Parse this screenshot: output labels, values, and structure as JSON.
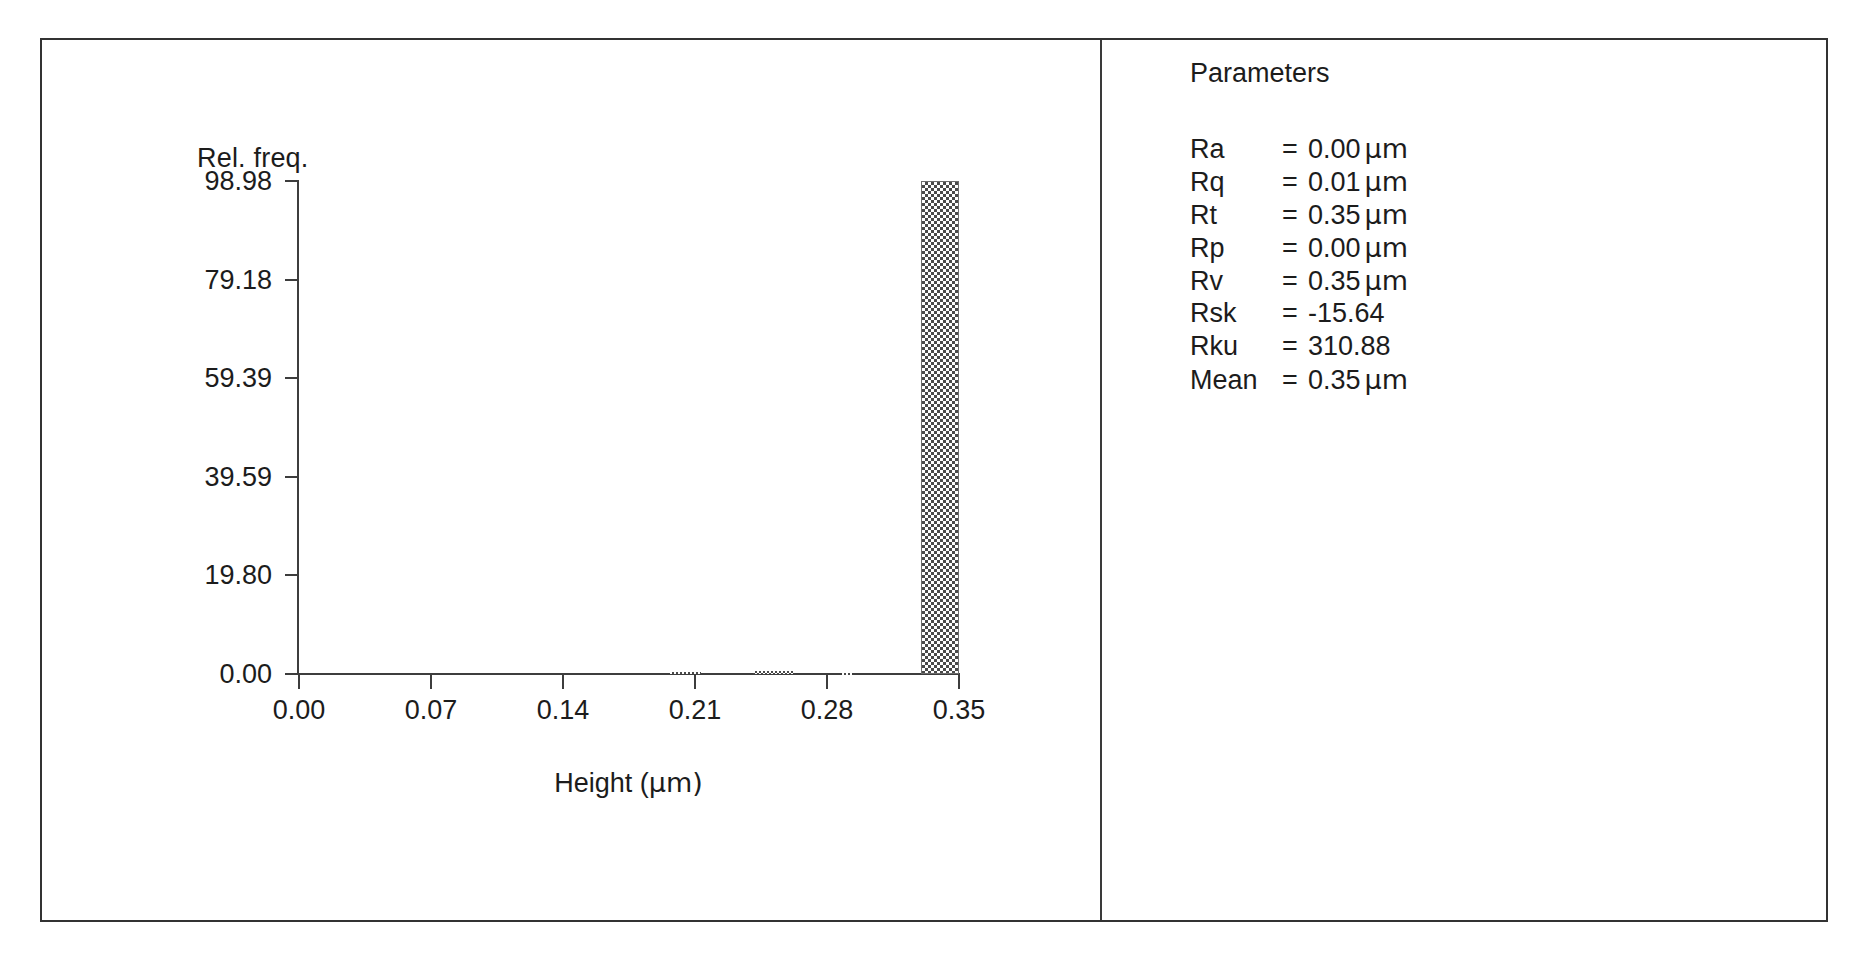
{
  "panels": {
    "plot_panel_name": "height-histogram-plot",
    "params_panel_name": "surface-roughness-parameters"
  },
  "parameters": {
    "title": "Parameters",
    "rows": [
      {
        "name": "Ra",
        "eq": "=",
        "value": "0.00",
        "unit": "µm"
      },
      {
        "name": "Rq",
        "eq": "=",
        "value": "0.01",
        "unit": "µm"
      },
      {
        "name": "Rt",
        "eq": "=",
        "value": "0.35",
        "unit": "µm"
      },
      {
        "name": "Rp",
        "eq": "=",
        "value": "0.00",
        "unit": "µm"
      },
      {
        "name": "Rv",
        "eq": "=",
        "value": "0.35",
        "unit": "µm"
      },
      {
        "name": "Rsk",
        "eq": "=",
        "value": "-15.64",
        "unit": ""
      },
      {
        "name": "Rku",
        "eq": "=",
        "value": "310.88",
        "unit": ""
      },
      {
        "name": "Mean",
        "eq": "=",
        "value": "0.35",
        "unit": "µm"
      }
    ]
  },
  "chart_data": {
    "type": "bar",
    "title": "",
    "subtitle": "",
    "ylabel": "Rel. freq.",
    "xlabel": "Height (µm)",
    "grid": false,
    "legend": null,
    "xlim": [
      0.0,
      0.35
    ],
    "ylim": [
      0.0,
      98.98
    ],
    "xticks": [
      "0.00",
      "0.07",
      "0.14",
      "0.21",
      "0.28",
      "0.35"
    ],
    "xtick_values": [
      0.0,
      0.07,
      0.14,
      0.21,
      0.28,
      0.35
    ],
    "yticks": [
      "0.00",
      "19.80",
      "39.59",
      "59.39",
      "79.18",
      "98.98"
    ],
    "ytick_values": [
      0.0,
      19.8,
      39.59,
      59.39,
      79.18,
      98.98
    ],
    "bar_fill": "dither-checkerboard",
    "bar_color": "#4a4a4a",
    "bars": [
      {
        "x": 0.213,
        "width": 0.016,
        "value": 0.35
      },
      {
        "x": 0.262,
        "width": 0.021,
        "value": 0.55
      },
      {
        "x": 0.293,
        "width": 0.005,
        "value": 0.12
      },
      {
        "x": 0.35,
        "width": 0.02,
        "value": 98.98
      }
    ],
    "note": "single dominant bin at the upper height limit (0.35 um); remaining bins are near-zero"
  }
}
